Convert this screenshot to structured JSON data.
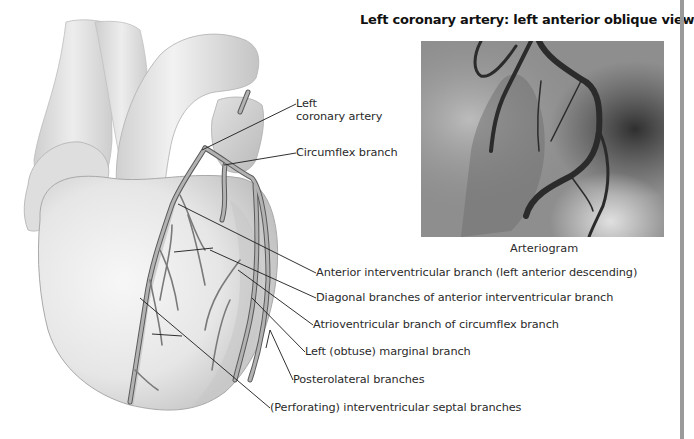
{
  "figure": {
    "title": "Left coronary artery: left anterior oblique view",
    "arteriogram": {
      "caption": "Arteriogram",
      "description": "Grayscale angiographic X-ray image of left coronary artery"
    },
    "labels": [
      {
        "id": "lca",
        "lines": [
          "Left",
          "coronary artery"
        ]
      },
      {
        "id": "circumflex",
        "text": "Circumflex branch"
      },
      {
        "id": "lad",
        "text": "Anterior interventricular branch (left anterior descending)"
      },
      {
        "id": "diagonal",
        "text": "Diagonal branches of anterior interventricular branch"
      },
      {
        "id": "av-branch",
        "text": "Atrioventricular branch of circumflex branch"
      },
      {
        "id": "obtuse-marginal",
        "text": "Left (obtuse) marginal branch"
      },
      {
        "id": "posterolateral",
        "text": "Posterolateral branches"
      },
      {
        "id": "septal",
        "text": "(Perforating) interventricular septal branches"
      }
    ]
  },
  "colors": {
    "background": "#ffffff",
    "heart_fill": "#e9e9e9",
    "heart_shadow": "#bdbdbd",
    "vessel": "#a9a9a9",
    "vessel_outline": "#5a5a5a",
    "leader_line": "#1a1a1a",
    "arteriogram_base": "#8a8a8a"
  }
}
